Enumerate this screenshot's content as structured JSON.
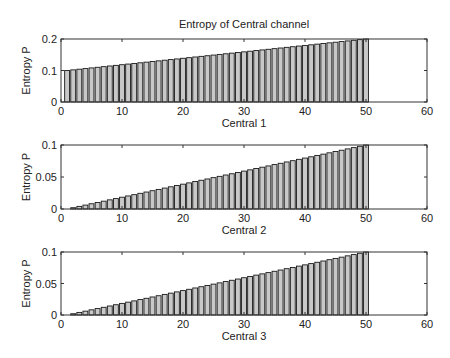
{
  "figure": {
    "title": "Entropy of Central channel",
    "bar_fill": "#c8c8c8",
    "bar_stroke": "#1a1a1a",
    "axis_color": "#333333"
  },
  "chart_data": [
    {
      "type": "bar",
      "title": "Entropy of Central channel",
      "xlabel": "Central 1",
      "ylabel": "Entropy P",
      "xlim": [
        0,
        60
      ],
      "ylim": [
        0,
        0.2
      ],
      "xticks": [
        0,
        10,
        20,
        30,
        40,
        50,
        60
      ],
      "yticks": [
        0,
        0.1,
        0.2
      ],
      "ytick_labels": [
        "0",
        "0.1",
        "0.2"
      ],
      "grid": false,
      "x": [
        1,
        2,
        3,
        4,
        5,
        6,
        7,
        8,
        9,
        10,
        11,
        12,
        13,
        14,
        15,
        16,
        17,
        18,
        19,
        20,
        21,
        22,
        23,
        24,
        25,
        26,
        27,
        28,
        29,
        30,
        31,
        32,
        33,
        34,
        35,
        36,
        37,
        38,
        39,
        40,
        41,
        42,
        43,
        44,
        45,
        46,
        47,
        48,
        49,
        50
      ],
      "values": [
        0.1,
        0.102,
        0.1041,
        0.1061,
        0.1082,
        0.1102,
        0.1122,
        0.1143,
        0.1163,
        0.1184,
        0.1204,
        0.1224,
        0.1245,
        0.1265,
        0.1286,
        0.1306,
        0.1327,
        0.1347,
        0.1367,
        0.1388,
        0.1408,
        0.1429,
        0.1449,
        0.1469,
        0.149,
        0.151,
        0.1531,
        0.1551,
        0.1571,
        0.1592,
        0.1612,
        0.1633,
        0.1653,
        0.1673,
        0.1694,
        0.1714,
        0.1735,
        0.1755,
        0.1776,
        0.1796,
        0.1816,
        0.1837,
        0.1857,
        0.1878,
        0.1898,
        0.1918,
        0.1939,
        0.1959,
        0.198,
        0.2
      ]
    },
    {
      "type": "bar",
      "title": "",
      "xlabel": "Central 2",
      "ylabel": "Entropy P",
      "xlim": [
        0,
        60
      ],
      "ylim": [
        0,
        0.1
      ],
      "xticks": [
        0,
        10,
        20,
        30,
        40,
        50,
        60
      ],
      "yticks": [
        0,
        0.05,
        0.1
      ],
      "ytick_labels": [
        "0",
        "0.05",
        "0.1"
      ],
      "grid": false,
      "x": [
        1,
        2,
        3,
        4,
        5,
        6,
        7,
        8,
        9,
        10,
        11,
        12,
        13,
        14,
        15,
        16,
        17,
        18,
        19,
        20,
        21,
        22,
        23,
        24,
        25,
        26,
        27,
        28,
        29,
        30,
        31,
        32,
        33,
        34,
        35,
        36,
        37,
        38,
        39,
        40,
        41,
        42,
        43,
        44,
        45,
        46,
        47,
        48,
        49,
        50
      ],
      "values": [
        0,
        0.002,
        0.0041,
        0.0061,
        0.0082,
        0.0102,
        0.0122,
        0.0143,
        0.0163,
        0.0184,
        0.0204,
        0.0224,
        0.0245,
        0.0265,
        0.0286,
        0.0306,
        0.0327,
        0.0347,
        0.0367,
        0.0388,
        0.0408,
        0.0429,
        0.0449,
        0.0469,
        0.049,
        0.051,
        0.0531,
        0.0551,
        0.0571,
        0.0592,
        0.0612,
        0.0633,
        0.0653,
        0.0673,
        0.0694,
        0.0714,
        0.0735,
        0.0755,
        0.0776,
        0.0796,
        0.0816,
        0.0837,
        0.0857,
        0.0878,
        0.0898,
        0.0918,
        0.0939,
        0.0959,
        0.098,
        0.1
      ]
    },
    {
      "type": "bar",
      "title": "",
      "xlabel": "Central 3",
      "ylabel": "Entropy P",
      "xlim": [
        0,
        60
      ],
      "ylim": [
        0,
        0.1
      ],
      "xticks": [
        0,
        10,
        20,
        30,
        40,
        50,
        60
      ],
      "yticks": [
        0,
        0.05,
        0.1
      ],
      "ytick_labels": [
        "0",
        "0.05",
        "0.1"
      ],
      "grid": false,
      "x": [
        1,
        2,
        3,
        4,
        5,
        6,
        7,
        8,
        9,
        10,
        11,
        12,
        13,
        14,
        15,
        16,
        17,
        18,
        19,
        20,
        21,
        22,
        23,
        24,
        25,
        26,
        27,
        28,
        29,
        30,
        31,
        32,
        33,
        34,
        35,
        36,
        37,
        38,
        39,
        40,
        41,
        42,
        43,
        44,
        45,
        46,
        47,
        48,
        49,
        50
      ],
      "values": [
        0,
        0.002,
        0.0041,
        0.0061,
        0.0082,
        0.0102,
        0.0122,
        0.0143,
        0.0163,
        0.0184,
        0.0204,
        0.0224,
        0.0245,
        0.0265,
        0.0286,
        0.0306,
        0.0327,
        0.0347,
        0.0367,
        0.0388,
        0.0408,
        0.0429,
        0.0449,
        0.0469,
        0.049,
        0.051,
        0.0531,
        0.0551,
        0.0571,
        0.0592,
        0.0612,
        0.0633,
        0.0653,
        0.0673,
        0.0694,
        0.0714,
        0.0735,
        0.0755,
        0.0776,
        0.0796,
        0.0816,
        0.0837,
        0.0857,
        0.0878,
        0.0898,
        0.0918,
        0.0939,
        0.0959,
        0.098,
        0.1
      ]
    }
  ]
}
